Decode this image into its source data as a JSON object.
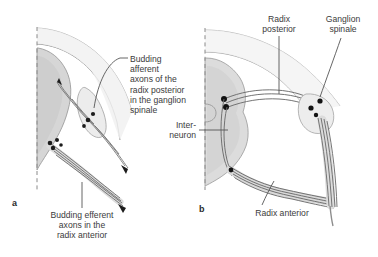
{
  "figure": {
    "type": "anatomical-diagram",
    "style": "grayscale line drawing with shaded gray matter"
  },
  "panels": [
    {
      "id": "a",
      "letter": "a",
      "description": "Early stage: budding axons from spinal cord and ganglion"
    },
    {
      "id": "b",
      "letter": "b",
      "description": "Later stage: formed dorsal and ventral roots with spinal ganglion"
    }
  ],
  "labels": {
    "afferent": "Budding afferent\naxons of the\nradix posterior\nin the ganglion\nspinale",
    "efferent": "Budding efferent\naxons in the\nradix anterior",
    "radix_posterior": "Radix\nposterior",
    "ganglion_spinale": "Ganglion\nspinale",
    "interneuron": "Inter-\nneuron",
    "radix_anterior": "Radix anterior"
  },
  "colors": {
    "background": "#ffffff",
    "text": "#3b3b3b",
    "outline": "#6e6e6e",
    "outline_light": "#9a9a9a",
    "gray_matter": "#d4d4d4",
    "gray_matter_dark": "#c2c2c2",
    "mantle": "#ececec",
    "nerve_fiber": "#7a7a7a",
    "cell_body": "#1a1a1a",
    "leader_line": "#555555",
    "midline_dash": "#8a8a8a"
  }
}
